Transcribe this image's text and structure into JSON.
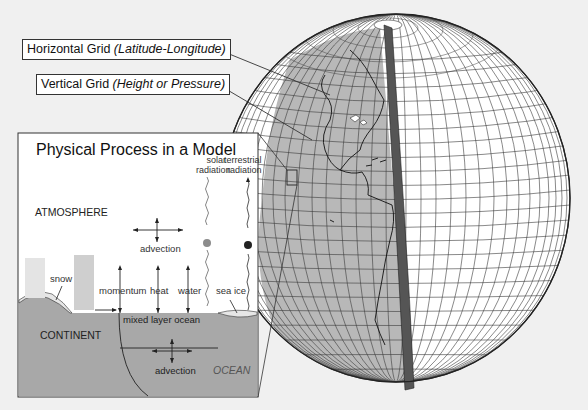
{
  "labels": {
    "horizontal_grid": {
      "main": "Horizontal Grid ",
      "detail": "(Latitude-Longitude)"
    },
    "vertical_grid": {
      "main": "Vertical Grid ",
      "detail": "(Height or Pressure)"
    }
  },
  "panel": {
    "title": "Physical Process in a Model",
    "atmosphere": "ATMOSPHERE",
    "solar_radiation_1": "solar",
    "solar_radiation_2": "radiation",
    "terrestrial_radiation_1": "terrestrial",
    "terrestrial_radiation_2": "radiation",
    "advection_air": "advection",
    "snow": "snow",
    "momentum": "momentum",
    "heat": "heat",
    "water": "water",
    "sea_ice": "sea ice",
    "mixed_layer_ocean": "mixed layer ocean",
    "continent": "CONTINENT",
    "advection_ocean": "advection",
    "ocean": "OCEAN"
  },
  "colors": {
    "background": "#f0f0f0",
    "land_gray": "#a8a8a8",
    "globe_land": "#b4b4b4",
    "grid_line": "#333333",
    "solar_dot": "#8c8c8c",
    "terrestrial_dot": "#222222"
  }
}
